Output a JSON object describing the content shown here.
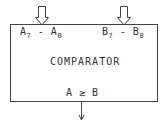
{
  "diagram": {
    "block": {
      "title": "COMPARATOR",
      "input_a": {
        "start": "A",
        "start_sub": "7",
        "sep": "-",
        "end": "A",
        "end_sub": "0"
      },
      "input_b": {
        "start": "B",
        "start_sub": "7",
        "sep": "-",
        "end": "B",
        "end_sub": "0"
      },
      "output": "A ≥ B"
    },
    "arrows": {
      "input_a": "hollow-bus-arrow-down",
      "input_b": "hollow-bus-arrow-down",
      "output": "single-line-arrow-down"
    },
    "colors": {
      "line": "#444444",
      "text": "#333333",
      "background": "#ffffff"
    }
  }
}
